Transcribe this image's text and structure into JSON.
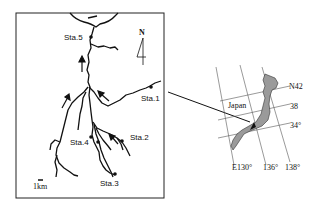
{
  "river_map": {
    "north_label": "N",
    "scale_label": "1km",
    "stations": [
      {
        "label": "Sta.1"
      },
      {
        "label": "Sta.2"
      },
      {
        "label": "Sta.3"
      },
      {
        "label": "Sta.4"
      },
      {
        "label": "Sta.5"
      }
    ]
  },
  "inset_map": {
    "country_label": "Japan",
    "latitudes": [
      "N42",
      "38",
      "34°"
    ],
    "longitudes": [
      "E130°",
      "136°",
      "138°"
    ]
  },
  "colors": {
    "land": "#9a9a9a",
    "line": "#111111"
  }
}
